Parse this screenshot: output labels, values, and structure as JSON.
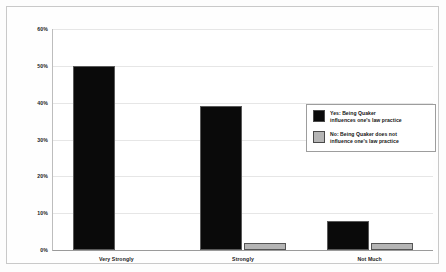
{
  "chart_data": {
    "type": "bar",
    "title": "",
    "xlabel": "",
    "ylabel": "",
    "categories": [
      "Very Strongly",
      "Strongly",
      "Not Much"
    ],
    "series": [
      {
        "name": "Yes: Being Quaker influences one's law practice",
        "color": "#0a0a0a",
        "values": [
          50,
          39,
          8
        ]
      },
      {
        "name": "No: Being Quaker does not influence one's law practice",
        "color": "#b5b5b5",
        "values": [
          0,
          2,
          2
        ]
      }
    ],
    "ylim": [
      0,
      60
    ],
    "yticks": [
      0,
      10,
      20,
      30,
      40,
      50,
      60
    ],
    "ytick_labels": [
      "0%",
      "10%",
      "20%",
      "30%",
      "40%",
      "50%",
      "60%"
    ],
    "grid": true,
    "legend_position": "center-right"
  },
  "legend": {
    "items": [
      {
        "swatch": "black-swatch",
        "line1": "Yes: Being Quaker",
        "line2": "influences one's law practice"
      },
      {
        "swatch": "gray-swatch",
        "line1": "No: Being Quaker does not",
        "line2": "influence one's law practice"
      }
    ]
  }
}
